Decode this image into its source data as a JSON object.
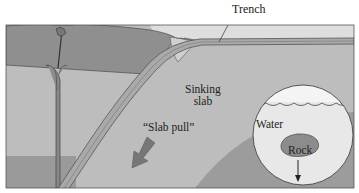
{
  "diagram": {
    "labels": {
      "trench": "Trench",
      "sinking_slab_line1": "Sinking",
      "sinking_slab_line2": "slab",
      "slab_pull": "“Slab pull”",
      "water": "Water",
      "rock": "Rock"
    },
    "inset": {
      "description": "Magnified circle showing rock sinking in water",
      "arrow_direction": "down"
    },
    "slab_pull_arrow_direction": "down-left",
    "colors": {
      "overriding_plate": "#8f8f8f",
      "mantle": "#bdbdbd",
      "slab": "#a9a9a9",
      "slab_edge": "#6a6a6a",
      "ocean": "#dcdcdc",
      "lower_layer": "#9a9a9a",
      "inset_water": "#e6e6e6",
      "rock": "#8c8c8c",
      "arrow": "#7a7a7a",
      "outline": "#333333"
    }
  }
}
